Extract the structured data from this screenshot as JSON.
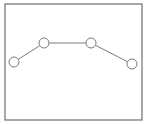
{
  "diagram": {
    "frame": {
      "x": 5,
      "y": 4,
      "width": 137,
      "height": 116,
      "stroke": "#6e6e6e"
    },
    "line_color": "#7a7a7a",
    "node_stroke": "#7a7a7a",
    "node_fill": "#ffffff",
    "node_radius": 5,
    "nodes": [
      {
        "id": "node-1",
        "cx": 14,
        "cy": 62
      },
      {
        "id": "node-2",
        "cx": 44,
        "cy": 43
      },
      {
        "id": "node-3",
        "cx": 91,
        "cy": 43
      },
      {
        "id": "node-4",
        "cx": 132,
        "cy": 64
      }
    ],
    "edges": [
      {
        "from": 0,
        "to": 1
      },
      {
        "from": 1,
        "to": 2
      },
      {
        "from": 2,
        "to": 3
      }
    ]
  }
}
